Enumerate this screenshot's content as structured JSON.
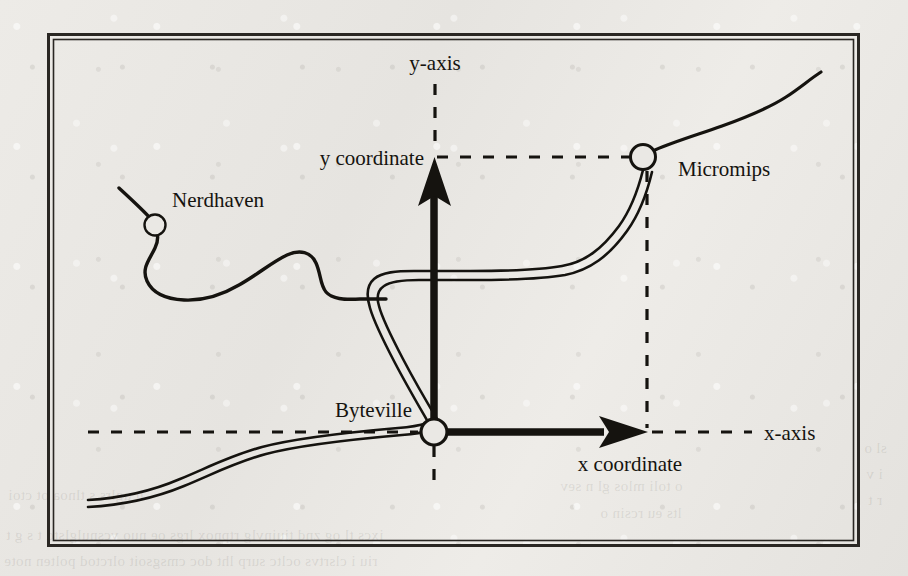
{
  "figure": {
    "type": "diagram",
    "background_color": "#eae8e4",
    "ink_color": "#15130f",
    "frame": {
      "x": 48,
      "y": 34,
      "width": 810,
      "height": 512,
      "style": "double-rule-box"
    }
  },
  "axes": {
    "origin_label": "Byteville",
    "y_axis_label": "y-axis",
    "x_axis_label": "x-axis",
    "y_coordinate_label": "y coordinate",
    "x_coordinate_label": "x coordinate",
    "origin_point": {
      "x": 434,
      "y": 432
    },
    "y_arrow_tip": {
      "x": 435,
      "y": 158
    },
    "x_arrow_tip": {
      "x": 647,
      "y": 432
    }
  },
  "cities": [
    {
      "name": "Nerdhaven",
      "node_x": 155,
      "node_y": 225,
      "radius": 10,
      "label_x": 172,
      "label_y": 205,
      "anchor": "start"
    },
    {
      "name": "Byteville",
      "node_x": 434,
      "node_y": 432,
      "radius": 13,
      "label_x": 412,
      "label_y": 415,
      "anchor": "end"
    },
    {
      "name": "Micromips",
      "node_x": 643,
      "node_y": 157,
      "radius": 12,
      "label_x": 676,
      "label_y": 176,
      "anchor": "start"
    }
  ],
  "guides": [
    {
      "name": "y-coordinate-guide",
      "orientation": "horizontal",
      "from_x": 436,
      "to_x": 644,
      "at_y": 157
    },
    {
      "name": "x-coordinate-guide",
      "orientation": "vertical",
      "at_x": 647,
      "from_y": 170,
      "to_y": 430
    },
    {
      "name": "y-axis-extension",
      "orientation": "vertical",
      "at_x": 435,
      "from_y": 84,
      "to_y": 152
    },
    {
      "name": "y-axis-below-origin",
      "orientation": "vertical",
      "at_x": 434,
      "from_y": 444,
      "to_y": 492
    },
    {
      "name": "x-axis-left-extension",
      "orientation": "horizontal",
      "from_x": 88,
      "to_x": 420,
      "at_y": 432
    },
    {
      "name": "x-axis-right-extension",
      "orientation": "horizontal",
      "from_x": 652,
      "to_x": 752,
      "at_y": 432
    }
  ],
  "roads": [
    {
      "name": "highway",
      "style": "double-line",
      "description": "major highway from lower-left through Byteville, hairpin north, east to Micromips and beyond"
    },
    {
      "name": "local-road",
      "style": "single-line",
      "description": "winding road from upper-left through Nerdhaven joining the highway"
    }
  ]
}
